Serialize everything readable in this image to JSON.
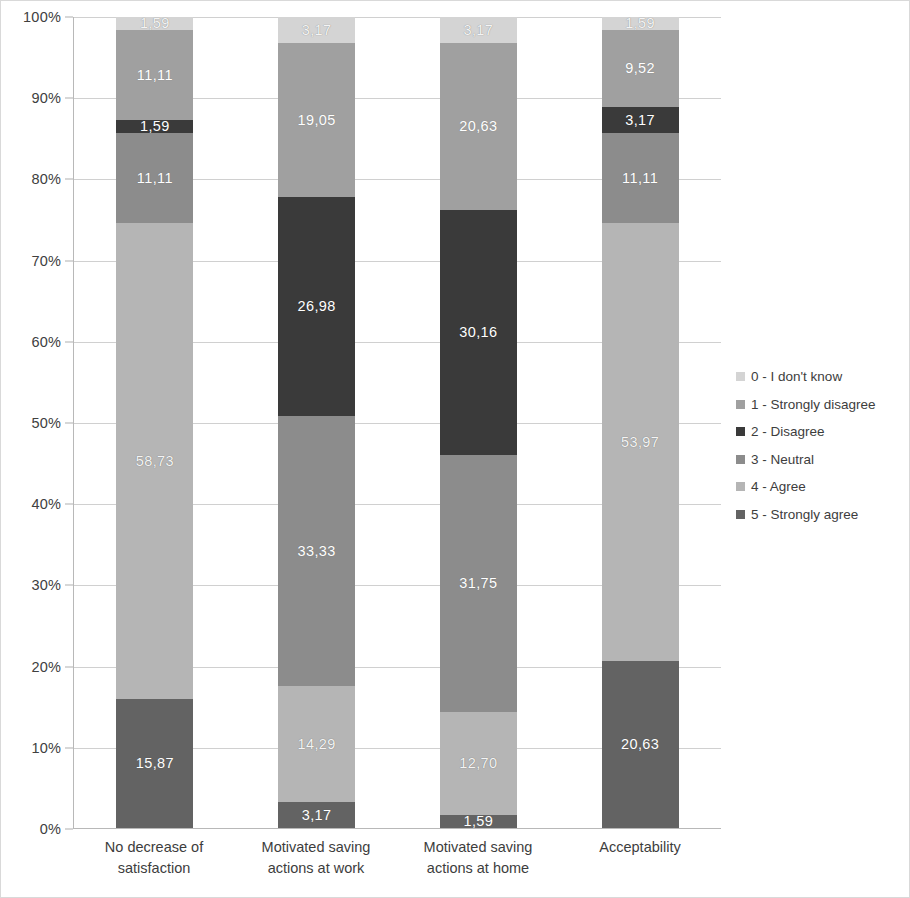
{
  "chart_data": {
    "type": "bar",
    "stacked": true,
    "stack_mode": "percent",
    "title": "",
    "subtitle": "",
    "xlabel": "",
    "ylabel": "",
    "ylim": [
      0,
      100
    ],
    "ytick_labels": [
      "0%",
      "10%",
      "20%",
      "30%",
      "40%",
      "50%",
      "60%",
      "70%",
      "80%",
      "90%",
      "100%"
    ],
    "ytick_values": [
      0,
      10,
      20,
      30,
      40,
      50,
      60,
      70,
      80,
      90,
      100
    ],
    "grid": true,
    "legend_position": "right",
    "categories": [
      "No decrease of satisfaction",
      "Motivated saving actions at work",
      "Motivated saving actions at home",
      "Acceptability"
    ],
    "category_lines": [
      [
        "No decrease of",
        "satisfaction"
      ],
      [
        "Motivated saving",
        "actions at work"
      ],
      [
        "Motivated saving",
        "actions at home"
      ],
      [
        "Acceptability",
        ""
      ]
    ],
    "series": [
      {
        "name": "5 - Strongly agree",
        "color": "#636363",
        "values": [
          15.87,
          3.17,
          1.59,
          20.63
        ],
        "labels": [
          "15,87",
          "3,17",
          "1,59",
          "20,63"
        ]
      },
      {
        "name": "4 - Agree",
        "color": "#b5b5b5",
        "values": [
          58.73,
          14.29,
          12.7,
          53.97
        ],
        "labels": [
          "58,73",
          "14,29",
          "12,70",
          "53,97"
        ]
      },
      {
        "name": "3 - Neutral",
        "color": "#8c8c8c",
        "values": [
          11.11,
          33.33,
          31.75,
          11.11
        ],
        "labels": [
          "11,11",
          "33,33",
          "31,75",
          "11,11"
        ]
      },
      {
        "name": "2 - Disagree",
        "color": "#3a3a3a",
        "values": [
          1.59,
          26.98,
          30.16,
          3.17
        ],
        "labels": [
          "1,59",
          "26,98",
          "30,16",
          "3,17"
        ]
      },
      {
        "name": "1 - Strongly disagree",
        "color": "#a0a0a0",
        "values": [
          11.11,
          19.05,
          20.63,
          9.52
        ],
        "labels": [
          "11,11",
          "19,05",
          "20,63",
          "9,52"
        ]
      },
      {
        "name": "0 - I don't know",
        "color": "#d4d4d4",
        "values": [
          1.59,
          3.17,
          3.17,
          1.59
        ],
        "labels": [
          "1,59",
          "3,17",
          "3,17",
          "1,59"
        ]
      }
    ],
    "legend_entries": [
      {
        "label": "0 - I don't know",
        "color": "#d4d4d4"
      },
      {
        "label": "1 - Strongly disagree",
        "color": "#a0a0a0"
      },
      {
        "label": "2 - Disagree",
        "color": "#3a3a3a"
      },
      {
        "label": "3 - Neutral",
        "color": "#8c8c8c"
      },
      {
        "label": "4 - Agree",
        "color": "#b5b5b5"
      },
      {
        "label": "5 - Strongly agree",
        "color": "#636363"
      }
    ]
  }
}
